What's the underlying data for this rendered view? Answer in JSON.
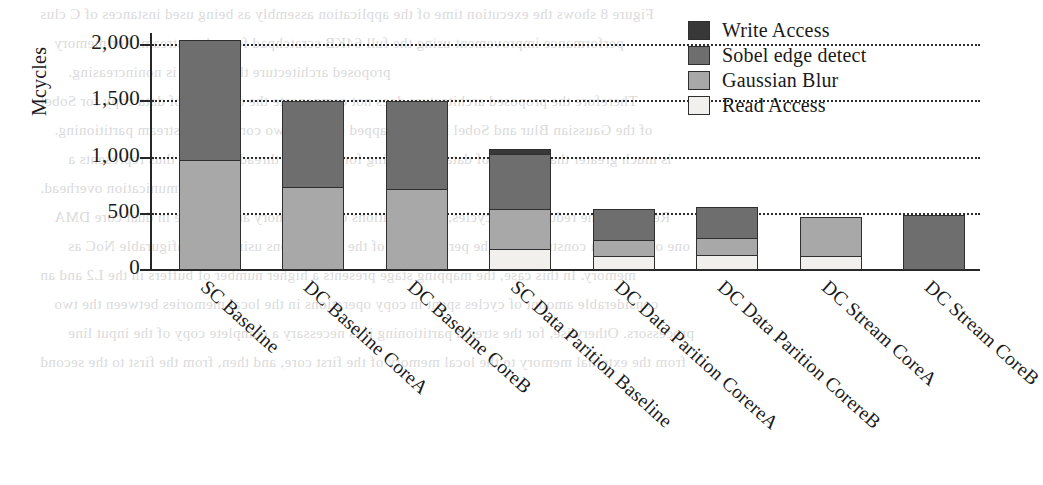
{
  "chart_data": {
    "type": "bar",
    "subtype": "stacked-vertical",
    "title": "",
    "xlabel": "",
    "ylabel": "Mcycles",
    "ylim": [
      0,
      2100
    ],
    "yticks": [
      0,
      500,
      1000,
      1500,
      2000
    ],
    "ytick_labels": [
      "0",
      "500",
      "1,000",
      "1,500",
      "2,000"
    ],
    "grid": "horizontal-dotted",
    "legend_position": "top-right",
    "categories": [
      "SC Baseline",
      "DC Baseline CoreA",
      "DC Baseline CoreB",
      "SC Data Parition Baseline",
      "DC Data Parition CorereA",
      "DC Data Parition CorereB",
      "DC Stream CoreA",
      "DC Stream CoreB"
    ],
    "series": [
      {
        "name": "Read Access",
        "color": "#f2f0ed",
        "values": [
          0,
          0,
          0,
          190,
          125,
          130,
          125,
          0
        ]
      },
      {
        "name": "Gaussian Blur",
        "color": "#a8a8a8",
        "values": [
          980,
          740,
          725,
          350,
          145,
          155,
          345,
          0
        ]
      },
      {
        "name": "Sobel edge detect",
        "color": "#6e6e6e",
        "values": [
          1070,
          760,
          775,
          490,
          270,
          275,
          0,
          490
        ]
      },
      {
        "name": "Write Access",
        "color": "#383838",
        "values": [
          0,
          0,
          0,
          45,
          0,
          0,
          0,
          0
        ]
      }
    ],
    "totals": [
      2050,
      1500,
      1500,
      1075,
      540,
      560,
      470,
      490
    ]
  },
  "legend": {
    "entries": [
      {
        "label": "Write Access"
      },
      {
        "label": "Sobel edge detect"
      },
      {
        "label": "Gaussian Blur"
      },
      {
        "label": "Read Access"
      }
    ]
  },
  "axis": {
    "y_title": "Mcycles",
    "y_ticks": [
      "2,000",
      "1,500",
      "1,000",
      "500",
      "0"
    ]
  },
  "background_text": {
    "lines": [
      "Figure 8 shows the execution time of the application assembly as being used instances of C clus",
      "performance improvement using the full 64KB scratchpad for a data stream. For memory",
      "proposed architecture the SRAM is nonincreasing.",
      "Therefore the proposed architecture does not compensate the overhead of data copy for Sobel",
      "of the Gaussian Blur and Sobel kernels mapped onto the two cores by the stream partitioning.",
      "is much greater than in case of data partitioning for the same thread size, and thus represents a",
      "communication overhead.",
      "Regarding the reduction on cycles, the limitations of the memory architecture in dual core DMA",
      "one of the main constraints on the performance of the applications using the configurable NoC as",
      "memory. In this case, the mapping stage presents a higher number of buffers in the L2 and an",
      "considerable amount of cycles spent in copy operations in the local memories between the two",
      "processors. Otherwise, for the stream partitioning it is necessary a complete copy of the input line",
      "from the external memory to the local memory of the first core, and then, from the first to the second"
    ]
  }
}
